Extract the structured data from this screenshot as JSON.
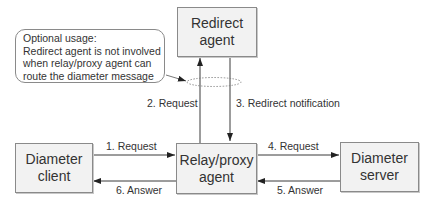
{
  "diagram": {
    "nodes": {
      "redirect_agent": {
        "line1": "Redirect",
        "line2": "agent"
      },
      "relay_proxy_agent": {
        "line1": "Relay/proxy",
        "line2": "agent"
      },
      "diameter_client": {
        "line1": "Diameter",
        "line2": "client"
      },
      "diameter_server": {
        "line1": "Diameter",
        "line2": "server"
      }
    },
    "note": {
      "line1": "Optional usage:",
      "line2": "Redirect agent is not involved",
      "line3": "when relay/proxy agent can",
      "line4": "route the diameter message"
    },
    "edges": [
      {
        "from": "Diameter client",
        "to": "Relay/proxy agent",
        "label": "1. Request"
      },
      {
        "from": "Relay/proxy agent",
        "to": "Redirect agent",
        "label": "2. Request"
      },
      {
        "from": "Redirect agent",
        "to": "Relay/proxy agent",
        "label": "3. Redirect notification"
      },
      {
        "from": "Relay/proxy agent",
        "to": "Diameter server",
        "label": "4. Request"
      },
      {
        "from": "Diameter server",
        "to": "Relay/proxy agent",
        "label": "5. Answer"
      },
      {
        "from": "Relay/proxy agent",
        "to": "Diameter client",
        "label": "6. Answer"
      }
    ],
    "colors": {
      "box_fill": "#f2f2f2",
      "box_border": "#8a8a8a",
      "line": "#3a3a3a"
    }
  }
}
